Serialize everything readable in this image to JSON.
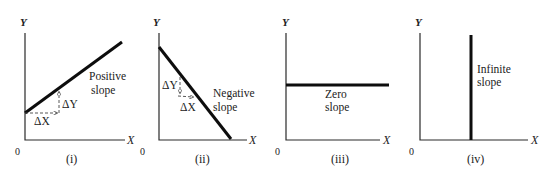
{
  "panels": [
    {
      "caption": "(i)",
      "x_label": "X",
      "y_label": "Y",
      "origin_label": "0",
      "slope_label_line1": "Positive",
      "slope_label_line2": "slope",
      "delta_y": "ΔY",
      "delta_x": "ΔX"
    },
    {
      "caption": "(ii)",
      "x_label": "X",
      "y_label": "Y",
      "origin_label": "0",
      "slope_label_line1": "Negative",
      "slope_label_line2": "slope",
      "delta_y": "ΔY",
      "delta_x": "ΔX"
    },
    {
      "caption": "(iii)",
      "x_label": "X",
      "y_label": "Y",
      "origin_label": "0",
      "slope_label_line1": "Zero",
      "slope_label_line2": "slope"
    },
    {
      "caption": "(iv)",
      "x_label": "X",
      "y_label": "Y",
      "origin_label": "0",
      "slope_label_line1": "Infinite",
      "slope_label_line2": "slope"
    }
  ]
}
